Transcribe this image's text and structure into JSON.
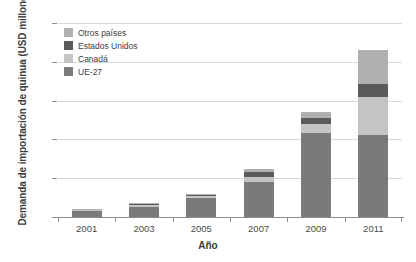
{
  "chart_data": {
    "type": "bar",
    "subtype": "stacked-bar",
    "title": "",
    "xlabel": "Año",
    "ylabel": "Demanda de importación de quinua (USD millones)",
    "categories": [
      "2001",
      "2003",
      "2005",
      "2007",
      "2009",
      "2011"
    ],
    "ylim": [
      0,
      50
    ],
    "yticks": [
      0,
      10,
      20,
      30,
      40,
      50
    ],
    "grid": true,
    "legend_position": "top-left",
    "series": [
      {
        "name": "UE-27",
        "color": "#7a7a7a",
        "values": [
          1.7,
          2.7,
          4.8,
          8.9,
          21.7,
          21.2
        ]
      },
      {
        "name": "Canadá",
        "color": "#c4c4c4",
        "values": [
          0.2,
          0.4,
          0.5,
          1.3,
          2.3,
          9.6
        ]
      },
      {
        "name": "Estados Unidos",
        "color": "#5b5b5b",
        "values": [
          0.1,
          0.3,
          0.4,
          1.3,
          1.5,
          3.5
        ]
      },
      {
        "name": "Otros países",
        "color": "#b0b0b0",
        "values": [
          0.1,
          0.2,
          0.2,
          1.0,
          1.5,
          8.7
        ]
      }
    ],
    "totals": [
      2.1,
      3.6,
      5.9,
      12.5,
      27.0,
      43.0
    ]
  }
}
